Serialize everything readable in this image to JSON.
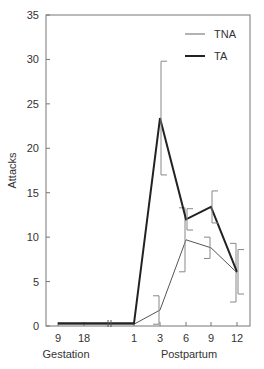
{
  "chart_data": {
    "type": "line",
    "title": "",
    "xlabel_groups": [
      "Gestation",
      "Postpartum"
    ],
    "ylabel": "Attacks",
    "ylim": [
      0,
      35
    ],
    "yticks": [
      0,
      5,
      10,
      15,
      20,
      25,
      30,
      35
    ],
    "categories": [
      "9",
      "18",
      "1",
      "3",
      "6",
      "9",
      "12"
    ],
    "axis_break_between": [
      "18",
      "1"
    ],
    "grid": false,
    "legend_position": "top-right",
    "series": [
      {
        "name": "TNA",
        "style": "thin",
        "values": [
          0.2,
          0.2,
          0.2,
          1.8,
          9.7,
          8.8,
          6.0
        ],
        "error": [
          0,
          0,
          0,
          1.6,
          3.6,
          1.2,
          3.3
        ]
      },
      {
        "name": "TA",
        "style": "thick",
        "values": [
          0.3,
          0.3,
          0.3,
          23.4,
          12.0,
          13.4,
          6.1
        ],
        "error": [
          0,
          0,
          0,
          6.4,
          1.2,
          1.8,
          2.5
        ]
      }
    ]
  }
}
